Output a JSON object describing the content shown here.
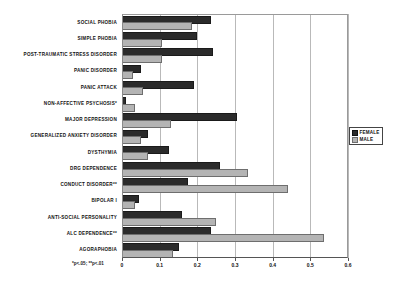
{
  "chart_data": {
    "type": "bar",
    "orientation": "horizontal",
    "title": "",
    "xlabel": "",
    "ylabel": "",
    "xlim": [
      0,
      0.6
    ],
    "xticks": [
      0,
      0.1,
      0.2,
      0.3,
      0.4,
      0.5,
      0.6
    ],
    "xticklabels": [
      "0",
      "0.1",
      "0.2",
      "0.3",
      "0.4",
      "0.5",
      "0.6"
    ],
    "grid": true,
    "grid_axis": "x",
    "legend_position": "right-middle",
    "categories": [
      "SOCIAL PHOBIA",
      "SIMPLE PHOBIA",
      "POST-TRAUMATIC STRESS DISORDER",
      "PANIC DISORDER",
      "PANIC ATTACK",
      "NON-AFFECTIVE PSYCHOSIS*",
      "MAJOR DEPRESSION",
      "GENERALIZED ANXIETY DISORDER",
      "DYSTHYMIA",
      "DRG DEPENDENCE",
      "CONDUCT DISORDER**",
      "BIPOLAR I",
      "ANTI-SOCIAL PERSONALITY",
      "ALC DEPENDENCE**",
      "AGORAPHOBIA"
    ],
    "series": [
      {
        "name": "FEMALE",
        "color": "#2b2b2b",
        "values": [
          0.23,
          0.195,
          0.235,
          0.045,
          0.185,
          0.005,
          0.3,
          0.065,
          0.12,
          0.255,
          0.17,
          0.04,
          0.155,
          0.23,
          0.145
        ]
      },
      {
        "name": "MALE",
        "color": "#b4b4b4",
        "values": [
          0.18,
          0.1,
          0.1,
          0.025,
          0.05,
          0.028,
          0.125,
          0.045,
          0.065,
          0.33,
          0.435,
          0.03,
          0.245,
          0.53,
          0.13
        ]
      }
    ],
    "annotations": {
      "significance_note": "*p<.05; **p<.01"
    }
  },
  "legend": {
    "items": [
      {
        "label": "FEMALE",
        "swatch": "female"
      },
      {
        "label": "MALE",
        "swatch": "male"
      }
    ]
  },
  "footnote": {
    "text": "*p<.05; **p<.01"
  },
  "caption": {
    "text": ""
  }
}
